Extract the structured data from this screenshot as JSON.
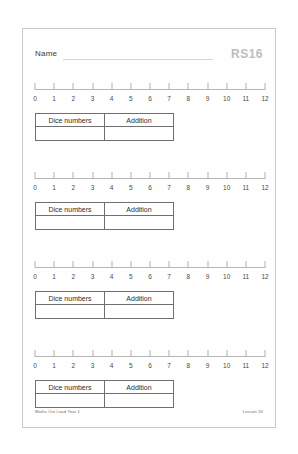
{
  "page": {
    "header": {
      "name_label": "Name",
      "code_label": "RS16"
    },
    "numberline": {
      "ticks": [
        0,
        1,
        2,
        3,
        4,
        5,
        6,
        7,
        8,
        9,
        10,
        11,
        12
      ],
      "min": 0,
      "max": 12
    },
    "table": {
      "headers": [
        "Dice numbers",
        "Addition"
      ],
      "answer_row": [
        "",
        ""
      ]
    },
    "blocks": [
      {
        "index": 1
      },
      {
        "index": 2
      },
      {
        "index": 3
      },
      {
        "index": 4
      }
    ],
    "footer": {
      "source": "Maths Out Loud Year 1",
      "lesson": "Lesson 53"
    }
  }
}
